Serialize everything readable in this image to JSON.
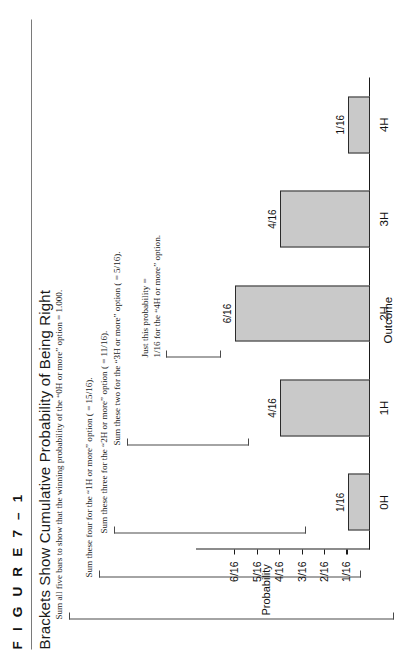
{
  "figure": {
    "number_label": "F I G U R E   7 – 1",
    "title": "Brackets Show Cumulative Probability of Being Right"
  },
  "annotations": [
    {
      "id": "note-0h",
      "text": "Sum all five bars to show that the winning probability of the “0H or more” option = 1.000."
    },
    {
      "id": "note-1h",
      "text": "Sum these four for the “1H or more” option ( = 15/16)."
    },
    {
      "id": "note-2h",
      "text": "Sum these three for the “2H or more” option ( = 11/16)."
    },
    {
      "id": "note-3h",
      "text": "Sum these two for the “3H or more” option ( = 5/16)."
    },
    {
      "id": "note-4h-line1",
      "text": "Just this probability ="
    },
    {
      "id": "note-4h-line2",
      "text": "1/16 for the “4H or more” option."
    }
  ],
  "chart_data": {
    "type": "bar",
    "title": "Brackets Show Cumulative Probability of Being Right",
    "xlabel": "Outcome",
    "ylabel": "Probability",
    "categories": [
      "0H",
      "1H",
      "2H",
      "3H",
      "4H"
    ],
    "values": [
      1,
      4,
      6,
      4,
      1
    ],
    "value_labels": [
      "1/16",
      "4/16",
      "6/16",
      "4/16",
      "1/16"
    ],
    "ytick_labels": [
      "1/16",
      "2/16",
      "3/16",
      "4/16",
      "5/16",
      "6/16"
    ],
    "ytick_values": [
      1,
      2,
      3,
      4,
      5,
      6
    ],
    "ylim": [
      0,
      6.6
    ],
    "grid": false,
    "legend": "none",
    "bar_fill": "#c9c9c9",
    "bar_stroke": "#2b2b2b",
    "axis_color": "#1a1a1a"
  }
}
